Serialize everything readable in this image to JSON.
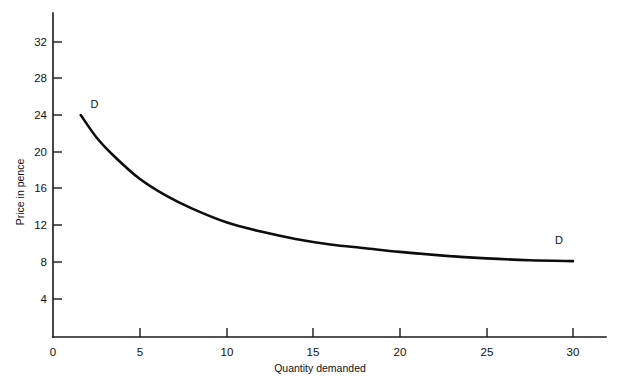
{
  "chart_data": {
    "type": "line",
    "title": "",
    "subtitle": "",
    "xlabel": "Quantity demanded",
    "ylabel": "Price in pence",
    "xlim": [
      0,
      31
    ],
    "ylim": [
      0,
      34
    ],
    "grid": false,
    "legend_position": "none",
    "x_ticks": [
      "0",
      "5",
      "10",
      "15",
      "20",
      "25",
      "30"
    ],
    "x_tick_values": [
      0,
      5,
      10,
      15,
      20,
      25,
      30
    ],
    "y_ticks": [
      "4",
      "8",
      "12",
      "16",
      "20",
      "24",
      "28",
      "32"
    ],
    "y_tick_values": [
      4,
      8,
      12,
      16,
      20,
      24,
      28,
      32
    ],
    "series": [
      {
        "name": "D",
        "x": [
          1.6,
          2.5,
          3.5,
          5.0,
          6.5,
          8.0,
          10.0,
          12.0,
          14.0,
          16.0,
          18.0,
          20.0,
          22.5,
          25.0,
          27.5,
          30.0
        ],
        "values": [
          24.0,
          21.6,
          19.6,
          17.1,
          15.3,
          13.9,
          12.4,
          11.4,
          10.6,
          10.0,
          9.6,
          9.2,
          8.8,
          8.5,
          8.3,
          8.2
        ]
      }
    ],
    "annotations": [
      {
        "text": "D",
        "x": 2.4,
        "y": 24.8
      },
      {
        "text": "D",
        "x": 29.2,
        "y": 10.1
      }
    ],
    "colors": {
      "curve": "#0d0d0d",
      "axis": "#1a1a1a",
      "text": "#111111",
      "background": "#ffffff"
    }
  }
}
